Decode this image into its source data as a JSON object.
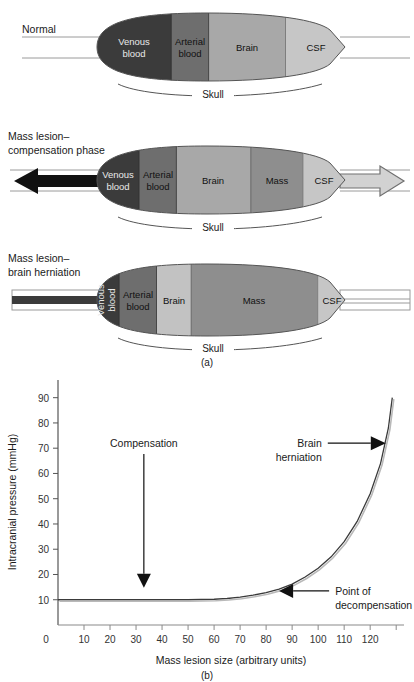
{
  "figure": {
    "panel_a_caption": "(a)",
    "panel_b_caption": "(b)",
    "skull_label": "Skull"
  },
  "panels": [
    {
      "id": "normal",
      "row_label_line1": "Normal",
      "row_label_line2": "",
      "left_flow": "none",
      "right_flow": "none",
      "segments": [
        {
          "name": "venous-blood",
          "label_line1": "Venous",
          "label_line2": "blood",
          "color": "#3b3b3b",
          "text_color": "#e9e9e9",
          "width_pct": 30.0,
          "vertical": false
        },
        {
          "name": "arterial-blood",
          "label_line1": "Arterial",
          "label_line2": "blood",
          "color": "#6e6e6e",
          "text_color": "#1a1a1a",
          "width_pct": 15.0,
          "vertical": false
        },
        {
          "name": "brain",
          "label_line1": "Brain",
          "label_line2": "",
          "color": "#a8a8a8",
          "text_color": "#1a1a1a",
          "width_pct": 31.0,
          "vertical": false
        },
        {
          "name": "csf",
          "label_line1": "CSF",
          "label_line2": "",
          "color": "#c6c6c6",
          "text_color": "#1a1a1a",
          "width_pct": 24.0,
          "vertical": false
        }
      ]
    },
    {
      "id": "compensation",
      "row_label_line1": "Mass lesion–",
      "row_label_line2": "compensation phase",
      "left_flow": "solid-black-arrow",
      "right_flow": "hollow-gray-arrow",
      "segments": [
        {
          "name": "venous-blood",
          "label_line1": "Venous",
          "label_line2": "blood",
          "color": "#3b3b3b",
          "text_color": "#e9e9e9",
          "width_pct": 17.0,
          "vertical": false
        },
        {
          "name": "arterial-blood",
          "label_line1": "Arterial",
          "label_line2": "blood",
          "color": "#6e6e6e",
          "text_color": "#1a1a1a",
          "width_pct": 15.0,
          "vertical": false
        },
        {
          "name": "brain",
          "label_line1": "Brain",
          "label_line2": "",
          "color": "#a8a8a8",
          "text_color": "#1a1a1a",
          "width_pct": 30.0,
          "vertical": false
        },
        {
          "name": "mass",
          "label_line1": "Mass",
          "label_line2": "",
          "color": "#8e8e8e",
          "text_color": "#1a1a1a",
          "width_pct": 21.0,
          "vertical": false
        },
        {
          "name": "csf",
          "label_line1": "CSF",
          "label_line2": "",
          "color": "#c6c6c6",
          "text_color": "#1a1a1a",
          "width_pct": 17.0,
          "vertical": false
        }
      ]
    },
    {
      "id": "herniation",
      "row_label_line1": "Mass lesion–",
      "row_label_line2": "brain herniation",
      "left_flow": "thin-dark-bar",
      "right_flow": "thin-double-line",
      "segments": [
        {
          "name": "venous-blood",
          "label_line1": "Venous",
          "label_line2": "blood",
          "color": "#3b3b3b",
          "text_color": "#e9e9e9",
          "width_pct": 9.0,
          "vertical": true
        },
        {
          "name": "arterial-blood",
          "label_line1": "Arterial",
          "label_line2": "blood",
          "color": "#6e6e6e",
          "text_color": "#1a1a1a",
          "width_pct": 15.0,
          "vertical": false
        },
        {
          "name": "brain",
          "label_line1": "Brain",
          "label_line2": "",
          "color": "#c2c2c2",
          "text_color": "#1a1a1a",
          "width_pct": 14.0,
          "vertical": false
        },
        {
          "name": "mass",
          "label_line1": "Mass",
          "label_line2": "",
          "color": "#8e8e8e",
          "text_color": "#1a1a1a",
          "width_pct": 51.0,
          "vertical": false
        },
        {
          "name": "csf",
          "label_line1": "CSF",
          "label_line2": "",
          "color": "#c6c6c6",
          "text_color": "#1a1a1a",
          "width_pct": 11.0,
          "vertical": false
        }
      ]
    }
  ],
  "chart_data": {
    "type": "line",
    "title": "",
    "xlabel": "Mass lesion size (arbitrary units)",
    "ylabel": "Intracranial pressure (mmHg)",
    "xlim": [
      0,
      133
    ],
    "ylim": [
      0,
      97
    ],
    "grid": false,
    "legend": "none",
    "xticks": [
      0,
      10,
      20,
      30,
      40,
      50,
      60,
      70,
      80,
      90,
      100,
      110,
      120
    ],
    "xtick_labels": [
      "0",
      "10",
      "20",
      "30",
      "40",
      "50",
      "60",
      "70",
      "80",
      "90",
      "100",
      "110",
      "120"
    ],
    "yticks": [
      10,
      20,
      30,
      40,
      50,
      60,
      70,
      80,
      90
    ],
    "ytick_labels": [
      "10",
      "20",
      "30",
      "40",
      "50",
      "60",
      "70",
      "80",
      "90"
    ],
    "x": [
      0,
      10,
      20,
      30,
      40,
      50,
      60,
      65,
      70,
      75,
      80,
      85,
      90,
      95,
      100,
      105,
      110,
      115,
      120,
      124,
      127,
      128.5
    ],
    "y": [
      10,
      10,
      10,
      10,
      10,
      10,
      10.2,
      10.5,
      11,
      11.8,
      12.8,
      14.2,
      16.2,
      19,
      22.5,
      27,
      33,
      41,
      52,
      64,
      78,
      90
    ],
    "annotations": [
      {
        "name": "compensation",
        "text": "Compensation",
        "text_line1": "Compensation",
        "text_line2": "",
        "arrow": "down",
        "target_x": 33,
        "target_y": 10
      },
      {
        "name": "point-of-decompensation",
        "text_line1": "Point of",
        "text_line2": "decompensation",
        "arrow": "left",
        "target_x": 85,
        "target_y": 13.5
      },
      {
        "name": "brain-herniation",
        "text_line1": "Brain",
        "text_line2": "herniation",
        "arrow": "right",
        "target_x": 126,
        "target_y": 72
      }
    ]
  }
}
